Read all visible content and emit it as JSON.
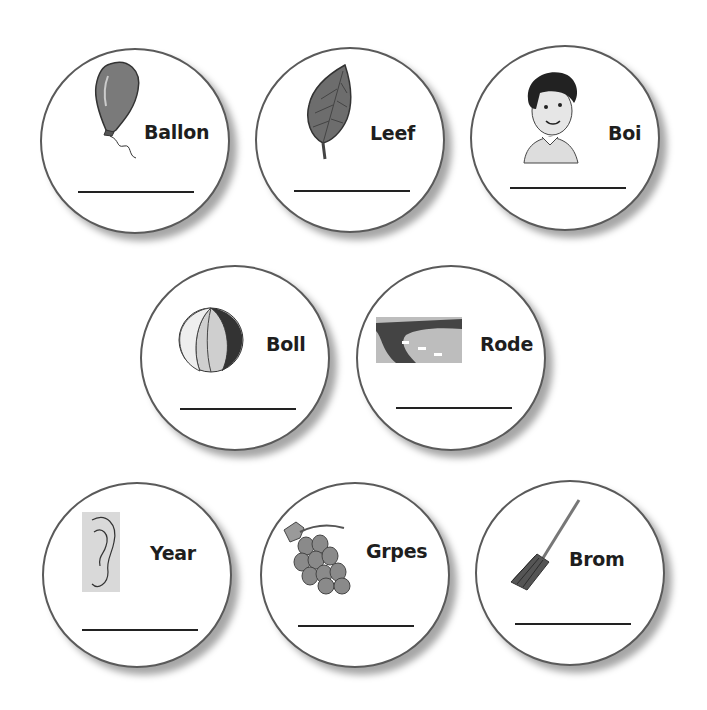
{
  "worksheet": {
    "cards": [
      {
        "word": "Ballon",
        "picture": "balloon-icon"
      },
      {
        "word": "Leef",
        "picture": "leaf-icon"
      },
      {
        "word": "Boi",
        "picture": "boy-icon"
      },
      {
        "word": "Boll",
        "picture": "ball-icon"
      },
      {
        "word": "Rode",
        "picture": "road-icon"
      },
      {
        "word": "Year",
        "picture": "ear-icon"
      },
      {
        "word": "Grpes",
        "picture": "grapes-icon"
      },
      {
        "word": "Brom",
        "picture": "broom-icon"
      }
    ],
    "answer_line_value": ""
  }
}
